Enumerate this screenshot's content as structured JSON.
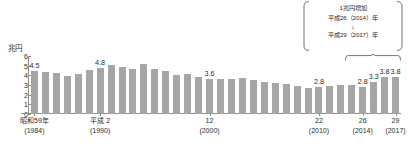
{
  "chart_data": {
    "type": "bar",
    "title": "",
    "subtitle": "",
    "xlabel": "",
    "ylabel": "兆円",
    "unit": "兆円",
    "ylim": [
      0,
      6
    ],
    "ytick_labels": [
      "6",
      "5",
      "4",
      "3",
      "2",
      "1",
      "0"
    ],
    "ytick_values": [
      6,
      5,
      4,
      3,
      2,
      1,
      0
    ],
    "grid": false,
    "legend": "none",
    "bar_color": "#a6a6a6",
    "categories": [
      "1984",
      "1985",
      "1986",
      "1987",
      "1988",
      "1989",
      "1990",
      "1991",
      "1992",
      "1993",
      "1994",
      "1995",
      "1996",
      "1997",
      "1998",
      "1999",
      "2000",
      "2001",
      "2002",
      "2003",
      "2004",
      "2005",
      "2006",
      "2007",
      "2008",
      "2009",
      "2010",
      "2011",
      "2012",
      "2013",
      "2014",
      "2015",
      "2016",
      "2017"
    ],
    "values": [
      4.5,
      4.3,
      4.2,
      3.9,
      4.1,
      4.6,
      4.8,
      5.1,
      4.9,
      4.7,
      5.2,
      4.7,
      4.4,
      4.0,
      4.1,
      3.8,
      3.6,
      3.6,
      3.6,
      3.7,
      3.5,
      3.3,
      3.2,
      3.1,
      2.9,
      2.7,
      2.8,
      2.9,
      3.0,
      3.0,
      2.8,
      3.3,
      3.8,
      3.8
    ],
    "point_labels": [
      {
        "category": "1984",
        "value": "4.5"
      },
      {
        "category": "1990",
        "value": "4.8"
      },
      {
        "category": "2000",
        "value": "3.6"
      },
      {
        "category": "2010",
        "value": "2.8"
      },
      {
        "category": "2014",
        "value": "2.8"
      },
      {
        "category": "2015",
        "value": "3.3"
      },
      {
        "category": "2016",
        "value": "3.8"
      },
      {
        "category": "2017",
        "value": "3.8"
      }
    ],
    "xtick_labels": [
      {
        "category": "1984",
        "line1": "昭和59年",
        "line2": "(1984)"
      },
      {
        "category": "1990",
        "line1": "平成 2",
        "line2": "(1990)"
      },
      {
        "category": "2000",
        "line1": "12",
        "line2": "(2000)"
      },
      {
        "category": "2010",
        "line1": "22",
        "line2": "(2010)"
      },
      {
        "category": "2014",
        "line1": "26",
        "line2": "(2014)"
      },
      {
        "category": "2017",
        "line1": "29",
        "line2": "(2017)"
      }
    ],
    "annotations": [
      {
        "name": "increase-callout",
        "line1": "1兆円増加",
        "line2": "平成26（2014）年",
        "arrow": "↓",
        "line3": "平成29（2017）年"
      },
      {
        "name": "group-bracket",
        "spans": [
          "2014",
          "2017"
        ]
      }
    ]
  }
}
